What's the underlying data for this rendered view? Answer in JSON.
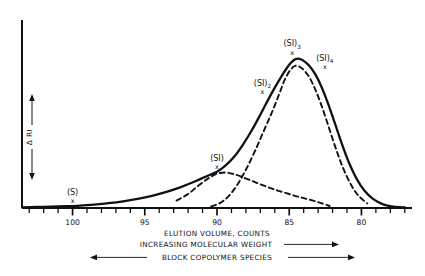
{
  "chart_data": {
    "type": "line",
    "title": "",
    "xlabel": "ELUTION VOLUME, COUNTS",
    "ylabel": "Δ RI",
    "xlim": [
      103.5,
      76.5
    ],
    "ylim": [
      0,
      1.08
    ],
    "x_axis_reversed": true,
    "grid": false,
    "legend": "none",
    "x_major_ticks": [
      100,
      95,
      90,
      85,
      80
    ],
    "x_major_tick_labels": [
      "100",
      "95",
      "90",
      "85",
      "80"
    ],
    "x_minor_tick_step": 1,
    "series": [
      {
        "name": "total-envelope",
        "style": "solid",
        "color": "#111111",
        "x": [
          103.5,
          102.5,
          101.5,
          100.5,
          99.5,
          98.5,
          97.5,
          96.5,
          95.5,
          94.5,
          93.5,
          92.5,
          91.5,
          90.8,
          90.0,
          89.4,
          88.8,
          88.2,
          87.6,
          87.0,
          86.5,
          86.0,
          85.6,
          85.2,
          84.9,
          84.6,
          84.3,
          84.0,
          83.6,
          83.2,
          82.8,
          82.4,
          82.0,
          81.6,
          81.2,
          80.8,
          80.3,
          79.8,
          79.2,
          78.5,
          77.8,
          77.0
        ],
        "y": [
          0.004,
          0.006,
          0.008,
          0.011,
          0.015,
          0.021,
          0.029,
          0.04,
          0.055,
          0.074,
          0.098,
          0.127,
          0.162,
          0.19,
          0.22,
          0.258,
          0.312,
          0.385,
          0.47,
          0.566,
          0.65,
          0.73,
          0.79,
          0.845,
          0.88,
          0.902,
          0.905,
          0.893,
          0.862,
          0.812,
          0.742,
          0.655,
          0.556,
          0.452,
          0.352,
          0.262,
          0.172,
          0.106,
          0.055,
          0.022,
          0.008,
          0.003
        ]
      },
      {
        "name": "component-SI",
        "style": "dashed",
        "color": "#111111",
        "x": [
          92.8,
          92.0,
          91.3,
          90.6,
          90.0,
          89.4,
          88.8,
          88.2,
          87.6,
          87.0,
          86.4,
          85.8,
          85.2,
          84.6,
          84.0,
          83.4,
          82.8,
          82.2
        ],
        "y": [
          0.045,
          0.085,
          0.135,
          0.18,
          0.208,
          0.215,
          0.205,
          0.186,
          0.165,
          0.144,
          0.124,
          0.106,
          0.09,
          0.074,
          0.06,
          0.046,
          0.03,
          0.012
        ]
      },
      {
        "name": "component-SI2-SI3-SI4",
        "style": "dashed",
        "color": "#111111",
        "x": [
          90.4,
          89.8,
          89.2,
          88.6,
          88.0,
          87.4,
          86.8,
          86.2,
          85.7,
          85.3,
          84.9,
          84.6,
          84.3,
          84.0,
          83.6,
          83.2,
          82.8,
          82.4,
          82.0,
          81.6,
          81.2,
          80.7,
          80.2,
          79.6
        ],
        "y": [
          0.01,
          0.03,
          0.072,
          0.14,
          0.232,
          0.34,
          0.46,
          0.58,
          0.69,
          0.78,
          0.84,
          0.862,
          0.858,
          0.838,
          0.792,
          0.72,
          0.63,
          0.528,
          0.42,
          0.318,
          0.228,
          0.138,
          0.074,
          0.028
        ]
      }
    ],
    "annotations": [
      {
        "name": "S",
        "label": "(S)",
        "sub": "",
        "x": 100.0,
        "marker": "x",
        "marker_y": 0.01
      },
      {
        "name": "SI",
        "label": "(SI)",
        "sub": "",
        "x": 90.0,
        "marker": "x",
        "marker_y": 0.218
      },
      {
        "name": "SI2",
        "label": "(SI)",
        "sub": "2",
        "x": 86.3,
        "marker": "x",
        "marker_y": 0.672
      },
      {
        "name": "SI3",
        "label": "(SI)",
        "sub": "3",
        "x": 84.8,
        "marker": "x",
        "marker_y": 0.905
      },
      {
        "name": "SI4",
        "label": "(SI)",
        "sub": "4",
        "x": 83.3,
        "marker": "x",
        "marker_y": 0.8
      }
    ],
    "captions": [
      {
        "name": "elution-volume",
        "text": "ELUTION VOLUME, COUNTS",
        "arrows": "none"
      },
      {
        "name": "molecular-weight",
        "text": "INCREASING MOLECULAR WEIGHT",
        "arrows": "right"
      },
      {
        "name": "block-copolymer",
        "text": "BLOCK COPOLYMER SPECIES",
        "arrows": "both"
      }
    ]
  },
  "axis": {
    "y_label": "Δ RI",
    "y_arrow_up": "▲",
    "y_arrow_down": "▼"
  },
  "colors": {
    "ink": "#111111",
    "background": "#ffffff"
  }
}
